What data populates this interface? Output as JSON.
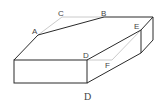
{
  "diagram": {
    "type": "geometry-solid",
    "caption": "D",
    "colors": {
      "edge": "#2a2a2a",
      "hidden": "#bdbdbd",
      "label": "#444444"
    },
    "labels": {
      "A": "A",
      "B": "B",
      "C": "C",
      "D": "D",
      "E": "E",
      "F": "F"
    }
  }
}
